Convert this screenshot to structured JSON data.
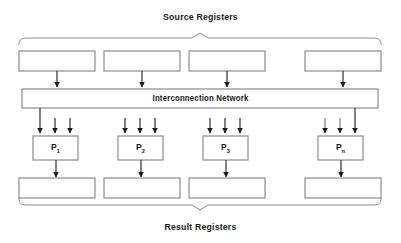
{
  "diagram": {
    "title_top": "Source  Registers",
    "title_bottom": "Result  Registers",
    "network_label": "Interconnection Network",
    "colors": {
      "stroke": "#8c8c8c",
      "arrow": "#1a1a1a",
      "text": "#1a1a1a",
      "background": "#ffffff"
    },
    "processors": [
      {
        "id": "p1",
        "label": "P",
        "subscript": "1"
      },
      {
        "id": "p2",
        "label": "P",
        "subscript": "2"
      },
      {
        "id": "p3",
        "label": "P",
        "subscript": "3"
      },
      {
        "id": "pn",
        "label": "P",
        "subscript": "n"
      }
    ],
    "source_registers": [
      {
        "id": "source-register-1",
        "label": ""
      },
      {
        "id": "source-register-2",
        "label": ""
      },
      {
        "id": "source-register-3",
        "label": ""
      },
      {
        "id": "source-register-4",
        "label": ""
      }
    ],
    "result_registers": [
      {
        "id": "result-register-1",
        "label": ""
      },
      {
        "id": "result-register-2",
        "label": ""
      },
      {
        "id": "result-register-3",
        "label": ""
      },
      {
        "id": "result-register-4",
        "label": ""
      }
    ],
    "counts": {
      "source_registers": 4,
      "result_registers": 4,
      "processors": 4,
      "inputs_per_processor": 3
    }
  }
}
